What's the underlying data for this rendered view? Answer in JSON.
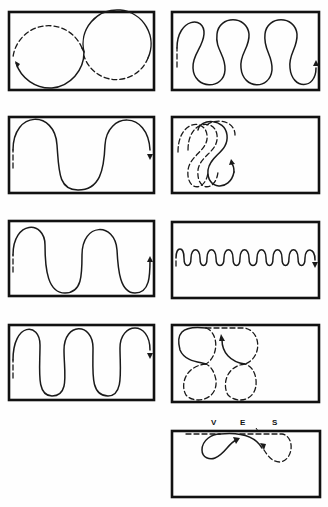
{
  "figure": {
    "panels": [
      {
        "id": "p1",
        "position": "row1-left",
        "pattern": "two adjacent circles (figure-eight), solid and dashed halves, arrow on left"
      },
      {
        "id": "p2",
        "position": "row1-right",
        "pattern": "serpentine with narrow-neck loops, 3.5 waves, arrow up at right"
      },
      {
        "id": "p3",
        "position": "row2-left",
        "pattern": "wide serpentine, 1.5 waves, arrow down at right"
      },
      {
        "id": "p4",
        "position": "row2-right",
        "pattern": "overlapping dashed figure-eight loops at left, arrow up"
      },
      {
        "id": "p5",
        "position": "row3-left",
        "pattern": "serpentine, 2.5 waves, arrow up at right"
      },
      {
        "id": "p6",
        "position": "row3-right",
        "pattern": "small tight sine wave across middle, arrow down at right"
      },
      {
        "id": "p7",
        "position": "row4-left",
        "pattern": "serpentine, 3 waves, arrow down at right"
      },
      {
        "id": "p8",
        "position": "row4-right",
        "pattern": "four circles in 2x2 arrangement, mostly dashed, arrow up"
      },
      {
        "id": "p9",
        "position": "row5-right",
        "pattern": "loop path along top edge with letters V, E, S; solid loop left, dashed loop right"
      }
    ],
    "labels": {
      "v": "V",
      "e": "E",
      "s": "S"
    }
  }
}
